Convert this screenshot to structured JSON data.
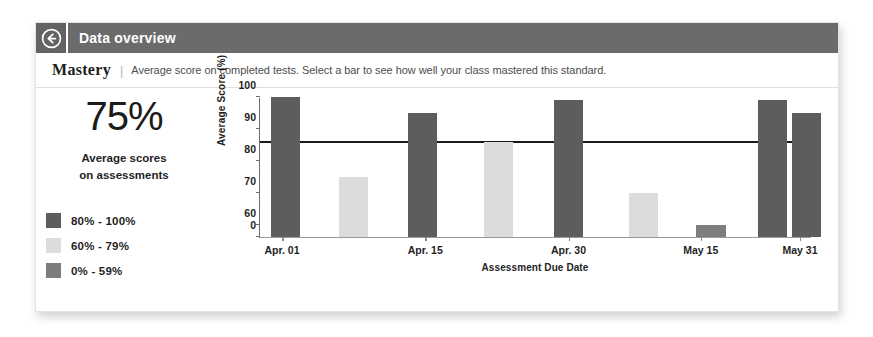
{
  "header": {
    "back_icon": "back-arrow-circle-icon",
    "title": "Data overview",
    "bar_color": "#6b6b6b"
  },
  "mastery": {
    "title": "Mastery",
    "separator": "|",
    "subtitle": "Average score on completed tests. Select a bar to see how well your class mastered this standard."
  },
  "summary": {
    "big_percent": "75%",
    "caption_line1": "Average scores",
    "caption_line2": "on assessments",
    "legend": [
      {
        "label": "80% - 100%",
        "color": "#5d5d5d"
      },
      {
        "label": "60% - 79%",
        "color": "#dcdcdc"
      },
      {
        "label": "0% - 59%",
        "color": "#7d7d7d"
      }
    ]
  },
  "chart_data": {
    "type": "bar",
    "title": "",
    "xlabel": "Assessment Due Date",
    "ylabel": "Average Score (%)",
    "ylim": [
      0,
      100
    ],
    "ybreak": true,
    "yticks": [
      0,
      60,
      70,
      80,
      90,
      100
    ],
    "ytick_labels": [
      "0",
      "60",
      "70",
      "80",
      "90",
      "100"
    ],
    "xticks": [
      "Apr. 01",
      "Apr. 15",
      "Apr. 30",
      "May 15",
      "May 31"
    ],
    "xtick_positions_pct": [
      4.0,
      30.0,
      56.0,
      80.0,
      98.0
    ],
    "grid": false,
    "legend_position": "left-panel",
    "threshold": {
      "value": 85.5,
      "label": "",
      "color": "#1a1a1a"
    },
    "bars": [
      {
        "x": "Apr. 01",
        "value": 100,
        "band": "80% - 100%",
        "color": "#5d5d5d",
        "left_pct": 2.0,
        "width_pct": 5.3
      },
      {
        "x": "",
        "value": 75,
        "band": "60% - 79%",
        "color": "#dcdcdc",
        "left_pct": 14.3,
        "width_pct": 5.3
      },
      {
        "x": "Apr. 15",
        "value": 95,
        "band": "80% - 100%",
        "color": "#5d5d5d",
        "left_pct": 26.8,
        "width_pct": 5.3
      },
      {
        "x": "",
        "value": 86,
        "band": "60% - 79%",
        "color": "#dcdcdc",
        "left_pct": 40.6,
        "width_pct": 5.3
      },
      {
        "x": "Apr. 30",
        "value": 99,
        "band": "80% - 100%",
        "color": "#5d5d5d",
        "left_pct": 53.3,
        "width_pct": 5.3
      },
      {
        "x": "",
        "value": 70,
        "band": "60% - 79%",
        "color": "#dcdcdc",
        "left_pct": 67.0,
        "width_pct": 5.3
      },
      {
        "x": "May 15",
        "value": 59,
        "band": "0% - 59%",
        "color": "#7d7d7d",
        "left_pct": 79.2,
        "width_pct": 5.3
      },
      {
        "x": "May 31",
        "value": 99,
        "band": "80% - 100%",
        "color": "#5d5d5d",
        "left_pct": 90.4,
        "width_pct": 5.3
      },
      {
        "x": "",
        "value": 95,
        "band": "80% - 100%",
        "color": "#5d5d5d",
        "left_pct": 96.6,
        "width_pct": 5.3
      }
    ]
  }
}
